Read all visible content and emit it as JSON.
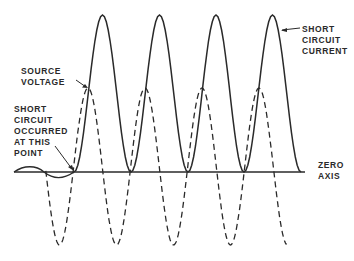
{
  "labels": {
    "source_voltage": "SOURCE\nVOLTAGE",
    "short_circuit_occurred": "SHORT\nCIRCUIT\nOCCURRED\nAT THIS\nPOINT",
    "short_circuit_current": "SHORT\nCIRCUIT\nCURRENT",
    "zero_axis": "ZERO\nAXIS"
  },
  "colors": {
    "ink": "#2a2a2a",
    "background": "#ffffff"
  },
  "waveforms": {
    "axis_y": 172,
    "axis_x_start": 14,
    "axis_x_end": 305,
    "current_peaks_x": [
      102,
      160,
      216,
      273
    ],
    "current_peak_y": 15,
    "current_zero_touch_x": [
      74,
      131,
      188,
      244,
      301
    ],
    "voltage_peaks_x": [
      88,
      145,
      201,
      258
    ],
    "voltage_peak_y": 88,
    "voltage_troughs_x": [
      60,
      117,
      173,
      230
    ],
    "voltage_trough_y": 245
  }
}
